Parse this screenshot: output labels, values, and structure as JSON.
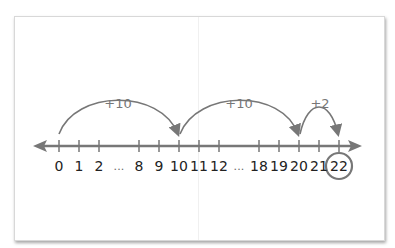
{
  "colors": {
    "line": "#777777",
    "label": "#222222",
    "jump_label": "#777777",
    "circle": "#777777"
  },
  "number_line": {
    "ticks": [
      {
        "label": "0",
        "x": 59
      },
      {
        "label": "1",
        "x": 79
      },
      {
        "label": "2",
        "x": 99
      },
      {
        "label": "...",
        "x": 119,
        "gap": true
      },
      {
        "label": "8",
        "x": 139
      },
      {
        "label": "9",
        "x": 159
      },
      {
        "label": "10",
        "x": 179
      },
      {
        "label": "11",
        "x": 199
      },
      {
        "label": "12",
        "x": 219
      },
      {
        "label": "...",
        "x": 239,
        "gap": true
      },
      {
        "label": "18",
        "x": 259
      },
      {
        "label": "19",
        "x": 279
      },
      {
        "label": "20",
        "x": 299
      },
      {
        "label": "21",
        "x": 319
      },
      {
        "label": "22",
        "x": 339
      }
    ],
    "highlighted": "22"
  },
  "jumps": [
    {
      "label": "+10",
      "from": "0",
      "to": "10"
    },
    {
      "label": "+10",
      "from": "10",
      "to": "20"
    },
    {
      "label": "+2",
      "from": "20",
      "to": "22"
    }
  ]
}
